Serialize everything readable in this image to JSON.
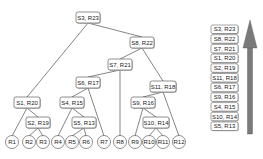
{
  "diagram": {
    "internal_nodes": [
      {
        "id": "n1",
        "label": "S3, R23",
        "x": 76,
        "y": 12,
        "w": 24,
        "h": 11
      },
      {
        "id": "n2",
        "label": "S8, R22",
        "x": 130,
        "y": 37,
        "w": 24,
        "h": 11
      },
      {
        "id": "n3",
        "label": "S7, R21",
        "x": 108,
        "y": 59,
        "w": 24,
        "h": 11
      },
      {
        "id": "n4",
        "label": "S6, R17",
        "x": 76,
        "y": 77,
        "w": 24,
        "h": 11
      },
      {
        "id": "n5",
        "label": "S11, R18",
        "x": 150,
        "y": 81,
        "w": 26,
        "h": 11
      },
      {
        "id": "n6",
        "label": "S1, R20",
        "x": 14,
        "y": 97,
        "w": 26,
        "h": 11
      },
      {
        "id": "n7",
        "label": "S4, R15",
        "x": 60,
        "y": 97,
        "w": 24,
        "h": 11
      },
      {
        "id": "n8",
        "label": "S9, R16",
        "x": 131,
        "y": 97,
        "w": 24,
        "h": 11
      },
      {
        "id": "n9",
        "label": "S2, R19",
        "x": 26,
        "y": 117,
        "w": 24,
        "h": 11
      },
      {
        "id": "n10",
        "label": "S5, R13",
        "x": 72,
        "y": 117,
        "w": 24,
        "h": 11
      },
      {
        "id": "n11",
        "label": "S10, R14",
        "x": 143,
        "y": 117,
        "w": 26,
        "h": 11
      }
    ],
    "leaves": [
      {
        "id": "R1",
        "label": "R1",
        "cx": 12,
        "cy": 142
      },
      {
        "id": "R2",
        "label": "R2",
        "cx": 29,
        "cy": 142
      },
      {
        "id": "R3",
        "label": "R3",
        "cx": 43,
        "cy": 142
      },
      {
        "id": "R4",
        "label": "R4",
        "cx": 58,
        "cy": 142
      },
      {
        "id": "R5",
        "label": "R5",
        "cx": 72,
        "cy": 142
      },
      {
        "id": "R6",
        "label": "R6",
        "cx": 86,
        "cy": 142
      },
      {
        "id": "R7",
        "label": "R7",
        "cx": 104,
        "cy": 142
      },
      {
        "id": "R8",
        "label": "R8",
        "cx": 120,
        "cy": 142
      },
      {
        "id": "R9",
        "label": "R9",
        "cx": 135,
        "cy": 142
      },
      {
        "id": "R10",
        "label": "R10",
        "cx": 149,
        "cy": 142
      },
      {
        "id": "R11",
        "label": "R11",
        "cx": 163,
        "cy": 142
      },
      {
        "id": "R12",
        "label": "R12",
        "cx": 179,
        "cy": 142
      }
    ],
    "edges": [
      [
        "n1",
        "n6"
      ],
      [
        "n1",
        "n2"
      ],
      [
        "n2",
        "n3"
      ],
      [
        "n2",
        "n5"
      ],
      [
        "n3",
        "n4"
      ],
      [
        "n3",
        "R8"
      ],
      [
        "n4",
        "n7"
      ],
      [
        "n4",
        "R7"
      ],
      [
        "n5",
        "n8"
      ],
      [
        "n5",
        "R12"
      ],
      [
        "n6",
        "R1"
      ],
      [
        "n6",
        "n9"
      ],
      [
        "n9",
        "R2"
      ],
      [
        "n9",
        "R3"
      ],
      [
        "n7",
        "R4"
      ],
      [
        "n7",
        "n10"
      ],
      [
        "n10",
        "R5"
      ],
      [
        "n10",
        "R6"
      ],
      [
        "n8",
        "R9"
      ],
      [
        "n8",
        "n11"
      ],
      [
        "n11",
        "R10"
      ],
      [
        "n11",
        "R11"
      ]
    ]
  },
  "legend": {
    "items": [
      "S3, R23",
      "S8, R22",
      "S7, R21",
      "S1, R20",
      "S2, R19",
      "S11, R18",
      "S6, R17",
      "S9, R16",
      "S4, R15",
      "S10, R14",
      "S5, R13"
    ],
    "arrow_color": "#7a7a7a",
    "direction": "up"
  }
}
